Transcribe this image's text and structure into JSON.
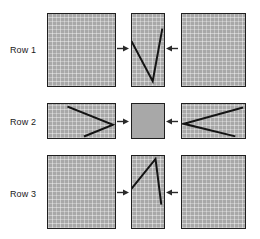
{
  "figure": {
    "title": "",
    "colors": {
      "panel_fill": "#a8a8a8",
      "panel_border": "#1f1f1f",
      "line_stroke": "#141414",
      "arrow_color": "#2a2a2a",
      "label_text": "#1a1a1a",
      "background": "#ffffff"
    },
    "rows": [
      {
        "label": "Row 1",
        "label_x": 10,
        "label_y": 45,
        "panels": [
          {
            "name": "row1-left-panel",
            "x": 47,
            "y": 13,
            "w": 69,
            "h": 74,
            "fill": "hatched",
            "shapes": []
          },
          {
            "name": "row1-middle-panel",
            "x": 131,
            "y": 13,
            "w": 34,
            "h": 74,
            "fill": "hatched",
            "shapes": [
              {
                "type": "polyline",
                "points": "0,29 22,69 32,16"
              }
            ]
          },
          {
            "name": "row1-right-panel",
            "x": 181,
            "y": 13,
            "w": 65,
            "h": 74,
            "fill": "hatched",
            "shapes": []
          }
        ],
        "arrows": [
          {
            "name": "row1-arrow-right",
            "dir": "right",
            "x": 117,
            "y": 44,
            "w": 12
          },
          {
            "name": "row1-arrow-left",
            "dir": "left",
            "x": 166,
            "y": 44,
            "w": 12
          }
        ]
      },
      {
        "label": "Row 2",
        "label_x": 10,
        "label_y": 117,
        "panels": [
          {
            "name": "row2-left-panel",
            "x": 47,
            "y": 103,
            "w": 69,
            "h": 36,
            "fill": "hatched",
            "shapes": [
              {
                "type": "polyline",
                "points": "21,3 67,22 38,34"
              }
            ]
          },
          {
            "name": "row2-middle-panel",
            "x": 131,
            "y": 103,
            "w": 34,
            "h": 36,
            "fill": "plain",
            "shapes": []
          },
          {
            "name": "row2-right-panel",
            "x": 181,
            "y": 103,
            "w": 65,
            "h": 36,
            "fill": "hatched",
            "shapes": [
              {
                "type": "polyline",
                "points": "62,4 2,21 54,34"
              }
            ]
          }
        ],
        "arrows": [
          {
            "name": "row2-arrow-right",
            "dir": "right",
            "x": 117,
            "y": 117,
            "w": 12
          },
          {
            "name": "row2-arrow-left",
            "dir": "left",
            "x": 166,
            "y": 117,
            "w": 12
          }
        ]
      },
      {
        "label": "Row 3",
        "label_x": 10,
        "label_y": 189,
        "panels": [
          {
            "name": "row3-left-panel",
            "x": 47,
            "y": 155,
            "w": 69,
            "h": 74,
            "fill": "hatched",
            "shapes": []
          },
          {
            "name": "row3-middle-panel",
            "x": 131,
            "y": 155,
            "w": 34,
            "h": 74,
            "fill": "hatched",
            "shapes": [
              {
                "type": "polyline",
                "points": "0,33 25,3 31,49"
              }
            ]
          },
          {
            "name": "row3-right-panel",
            "x": 181,
            "y": 155,
            "w": 65,
            "h": 74,
            "fill": "hatched",
            "shapes": []
          }
        ],
        "arrows": [
          {
            "name": "row3-arrow-right",
            "dir": "right",
            "x": 117,
            "y": 188,
            "w": 12
          },
          {
            "name": "row3-arrow-left",
            "dir": "left",
            "x": 166,
            "y": 188,
            "w": 12
          }
        ]
      }
    ]
  }
}
